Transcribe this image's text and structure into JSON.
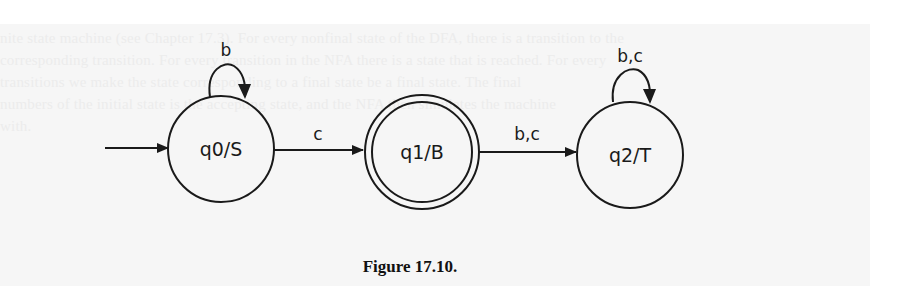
{
  "figure": {
    "caption": "Figure 17.10.",
    "background_text_lines": [
      "nite state machine (see Chapter 17.3). For every nonfinal state of the DFA, there is a transition to the",
      "corresponding transition. For every transition in the NFA there is a state that is reached. For every",
      "transitions we make the state corresponding to a final state be a final state. The final",
      "numbers of the initial state is the accepting state, and the NFA then simulates the machine",
      "with."
    ]
  },
  "states": [
    {
      "id": "q0",
      "label": "q0/S",
      "initial": true,
      "accepting": false
    },
    {
      "id": "q1",
      "label": "q1/B",
      "initial": false,
      "accepting": true
    },
    {
      "id": "q2",
      "label": "q2/T",
      "initial": false,
      "accepting": false
    }
  ],
  "transitions": [
    {
      "from": "q0",
      "to": "q0",
      "label": "b"
    },
    {
      "from": "q0",
      "to": "q1",
      "label": "c"
    },
    {
      "from": "q1",
      "to": "q2",
      "label": "b,c"
    },
    {
      "from": "q2",
      "to": "q2",
      "label": "b,c"
    }
  ],
  "colors": {
    "stroke": "#1a1a1a",
    "page_background": "#f6f6f6",
    "outer_background": "#ffffff"
  }
}
